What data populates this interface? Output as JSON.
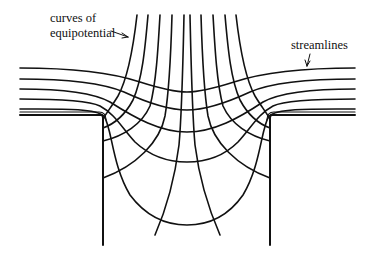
{
  "diagram": {
    "type": "flow-net",
    "labels": {
      "equipotential_line1": "curves of",
      "equipotential_line2": "equipotential",
      "streamlines": "streamlines"
    },
    "elements": {
      "streamlines_count_per_side": 5,
      "equipotential_curves_count": 10,
      "walls": [
        "left-wall",
        "right-wall"
      ],
      "stroke_color": "#111111",
      "background": "#ffffff"
    }
  }
}
